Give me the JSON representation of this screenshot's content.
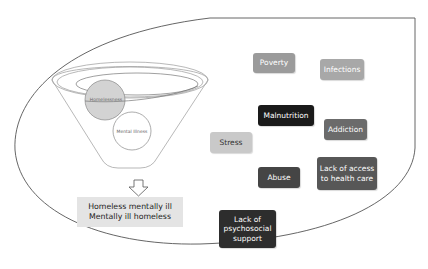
{
  "funnel": {
    "circle_top_label": "Homelessness",
    "circle_bottom_label": "Mental Illness",
    "circle_top_fill": "#d3d3d3",
    "stroke_color": "#8a8a8a"
  },
  "result": {
    "line1": "Homeless mentally ill",
    "line2": "Mentally ill homeless"
  },
  "factors": [
    {
      "label": "Poverty",
      "color": "#9b9b9b"
    },
    {
      "label": "Infections",
      "color": "#a8a8a8"
    },
    {
      "label": "Malnutrition",
      "color": "#1a1a1a"
    },
    {
      "label": "Addiction",
      "color": "#6b6b6b"
    },
    {
      "label": "Stress",
      "color": "#c9c9c9"
    },
    {
      "label": "Abuse",
      "color": "#454545"
    },
    {
      "label": "Lack of access to health care",
      "color": "#575757"
    },
    {
      "label": "Lack of psychosocial support",
      "color": "#2d2d2d"
    }
  ]
}
